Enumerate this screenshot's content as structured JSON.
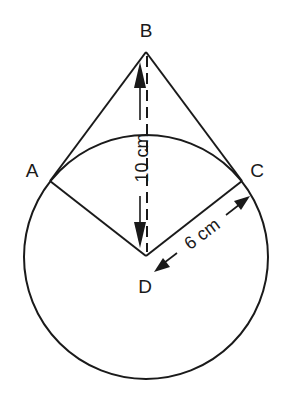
{
  "diagram": {
    "points": {
      "A": {
        "label": "A"
      },
      "B": {
        "label": "B"
      },
      "C": {
        "label": "C"
      },
      "D": {
        "label": "D"
      }
    },
    "dimensions": {
      "BD": {
        "label": "10 cm"
      },
      "DC": {
        "label": "6 cm"
      }
    },
    "colors": {
      "stroke": "#1a1a1a",
      "background": "#ffffff"
    }
  }
}
